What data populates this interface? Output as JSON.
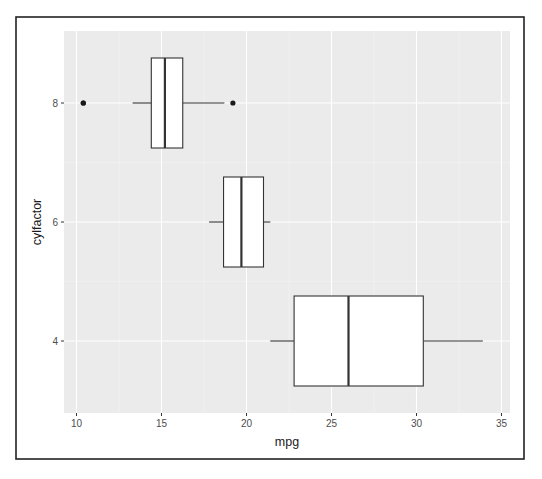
{
  "chart_data": {
    "type": "boxplot",
    "orientation": "horizontal",
    "title": "",
    "xlabel": "mpg",
    "ylabel": "cylfactor",
    "xlim": [
      9.3,
      35.5
    ],
    "x_ticks": [
      10,
      15,
      20,
      25,
      30,
      35
    ],
    "categories": [
      "4",
      "6",
      "8"
    ],
    "grid": true,
    "legend": null,
    "series": [
      {
        "category": "8",
        "whisker_low": 13.3,
        "q1": 14.4,
        "median": 15.2,
        "q3": 16.25,
        "whisker_high": 18.7,
        "outliers": [
          10.4,
          10.4,
          19.2
        ]
      },
      {
        "category": "6",
        "whisker_low": 17.8,
        "q1": 18.65,
        "median": 19.7,
        "q3": 21.0,
        "whisker_high": 21.4,
        "outliers": []
      },
      {
        "category": "4",
        "whisker_low": 21.4,
        "q1": 22.8,
        "median": 26.0,
        "q3": 30.4,
        "whisker_high": 33.9,
        "outliers": []
      }
    ]
  },
  "colors": {
    "panel_background": "#ebebeb",
    "grid_major": "#ffffff",
    "grid_minor": "#f4f4f4",
    "box_fill": "#ffffff",
    "box_stroke": "#333333",
    "outlier": "#1a1a1a",
    "frame": "#222222"
  }
}
